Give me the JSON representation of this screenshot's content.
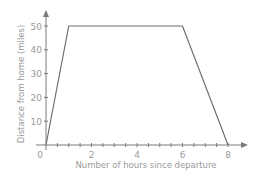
{
  "chart_data": {
    "type": "line",
    "title": "",
    "xlabel": "Number of hours since departure",
    "ylabel": "Distance from home (miles)",
    "x": [
      0,
      1,
      6,
      8
    ],
    "series": [
      {
        "name": "Distance",
        "values": [
          0,
          50,
          50,
          0
        ]
      }
    ],
    "xlim": [
      0,
      8.8
    ],
    "ylim": [
      0,
      57
    ],
    "x_ticks": [
      0,
      0.5,
      1,
      1.5,
      2,
      2.5,
      3,
      3.5,
      4,
      4.5,
      5,
      5.5,
      6,
      6.5,
      7,
      7.5,
      8
    ],
    "x_tick_labels": [
      "0",
      "2",
      "4",
      "6",
      "8"
    ],
    "x_tick_label_values": [
      0,
      2,
      4,
      6,
      8
    ],
    "y_ticks": [
      10,
      20,
      30,
      40,
      50
    ],
    "y_tick_labels": [
      "10",
      "20",
      "30",
      "40",
      "50"
    ],
    "grid": false,
    "legend": "none"
  },
  "colors": {
    "line": "#6e6e6e",
    "axis": "#7a7a7a",
    "text": "#9a9a9a"
  }
}
